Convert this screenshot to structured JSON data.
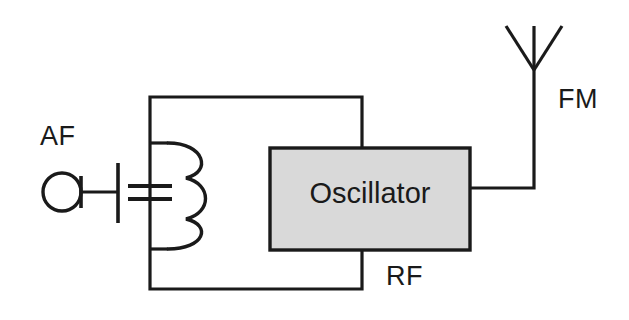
{
  "diagram": {
    "background_color": "#ffffff",
    "line_color": "#1a1a1a",
    "labels": {
      "af": "AF",
      "fm": "FM",
      "rf": "RF",
      "oscillator": "Oscillator"
    },
    "components": {
      "af_source": {
        "name": "audio-frequency-source",
        "symbol": "circle-with-terminal"
      },
      "capacitor": {
        "name": "variable-capacitor",
        "symbol": "two-parallel-plates"
      },
      "inductor": {
        "name": "inductor-coil",
        "symbol": "three-loop-coil",
        "loops": 3
      },
      "oscillator_block": {
        "name": "oscillator-block",
        "fill_color": "#d9d9d9",
        "border_color": "#1a1a1a"
      },
      "antenna": {
        "name": "antenna",
        "symbol": "v-dipole-with-mast"
      }
    }
  }
}
